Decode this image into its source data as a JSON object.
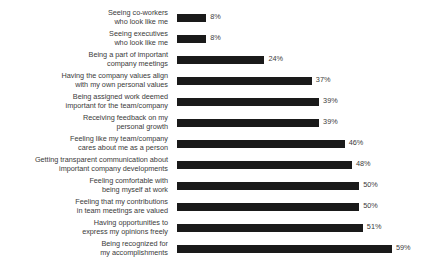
{
  "chart_data": {
    "type": "bar",
    "orientation": "horizontal",
    "title": "",
    "subtitle": "",
    "xlabel": "",
    "ylabel": "",
    "xlim": [
      0,
      59
    ],
    "grid": false,
    "legend": null,
    "value_suffix": "%",
    "bar_color": "#1a1a1a",
    "categories": [
      "Seeing co-workers\nwho look like me",
      "Seeing executives\nwho look like me",
      "Being a part of important\ncompany meetings",
      "Having the company values align\nwith my own personal values",
      "Being assigned work deemed\nimportant for the team/company",
      "Receiving feedback on my\npersonal growth",
      "Feeling like my team/company\ncares about me as a person",
      "Getting transparent communication about\nimportant company developments",
      "Feeling comfortable with\nbeing myself at work",
      "Feeling that my contributions\nin team meetings are valued",
      "Having opportunities to\nexpress my opinions freely",
      "Being recognized for\nmy accomplishments"
    ],
    "values": [
      8,
      8,
      24,
      37,
      39,
      39,
      46,
      48,
      50,
      50,
      51,
      59
    ],
    "value_labels": [
      "8%",
      "8%",
      "24%",
      "37%",
      "39%",
      "39%",
      "46%",
      "48%",
      "50%",
      "50%",
      "51%",
      "59%"
    ]
  }
}
